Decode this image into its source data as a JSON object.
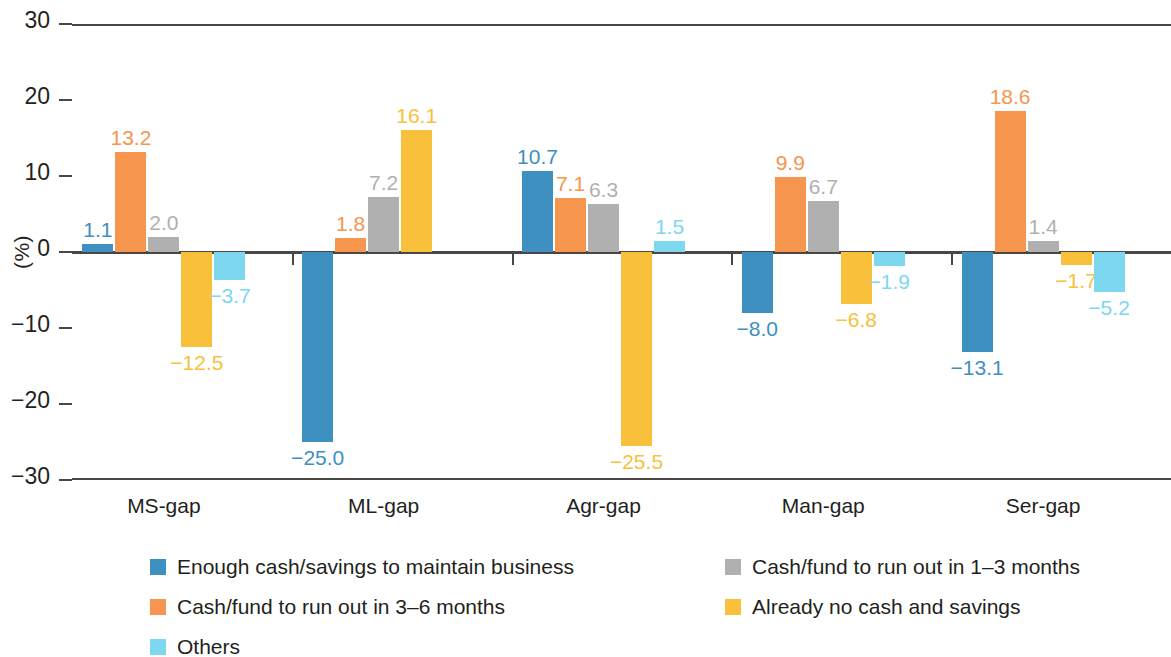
{
  "chart_data": {
    "type": "bar",
    "title": "",
    "subtitle": "",
    "xlabel": "",
    "ylabel": "(%)",
    "ylim": [
      -30,
      30
    ],
    "yticks": [
      "30",
      "20",
      "10",
      "0",
      "-10",
      "-20",
      "-30"
    ],
    "grid": false,
    "legend_position": "bottom",
    "orientation": "vertical-grouped",
    "categories": [
      "MS-gap",
      "ML-gap",
      "Agr-gap",
      "Man-gap",
      "Ser-gap"
    ],
    "series": [
      {
        "name": "Enough cash/savings to maintain business",
        "color": "#3E90C0",
        "values": [
          1.1,
          -25.0,
          10.7,
          -8.0,
          -13.1
        ],
        "labels": [
          "1.1",
          "−25.0",
          "10.7",
          "−8.0",
          "−13.1"
        ]
      },
      {
        "name": "Cash/fund to run out in 3–6 months",
        "color": "#F5954E",
        "values": [
          13.2,
          1.8,
          7.1,
          9.9,
          18.6
        ],
        "labels": [
          "13.2",
          "1.8",
          "7.1",
          "9.9",
          "18.6"
        ]
      },
      {
        "name": "Cash/fund to run out in 1–3 months",
        "color": "#B0B0B0",
        "values": [
          2.0,
          7.2,
          6.3,
          6.7,
          1.4
        ],
        "labels": [
          "2.0",
          "7.2",
          "6.3",
          "6.7",
          "1.4"
        ]
      },
      {
        "name": "Already no cash and savings",
        "color": "#F9C03C",
        "values": [
          -12.5,
          16.1,
          -25.5,
          -6.8,
          -1.7
        ],
        "labels": [
          "−12.5",
          "16.1",
          "−25.5",
          "−6.8",
          "−1.7"
        ]
      },
      {
        "name": "Others",
        "color": "#7CD7EF",
        "values": [
          -3.7,
          0.0,
          1.5,
          -1.9,
          -5.2
        ],
        "labels": [
          "−3.7",
          "",
          "1.5",
          "−1.9",
          "−5.2"
        ]
      }
    ],
    "legend": [
      {
        "label": "Enough cash/savings to maintain business",
        "color": "#3E90C0"
      },
      {
        "label": "Cash/fund to run out in 3–6 months",
        "color": "#F5954E"
      },
      {
        "label": "Cash/fund to run out in 1–3 months",
        "color": "#B0B0B0"
      },
      {
        "label": "Already no cash and savings",
        "color": "#F9C03C"
      },
      {
        "label": "Others",
        "color": "#7CD7EF"
      }
    ],
    "axis_color": "#4a4644",
    "text_color": "#231f20",
    "background": "#ffffff"
  }
}
